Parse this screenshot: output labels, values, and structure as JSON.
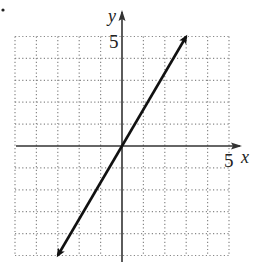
{
  "chart_data": {
    "type": "line",
    "title": "",
    "xlabel": "x",
    "ylabel": "y",
    "xlim": [
      -5,
      5
    ],
    "ylim": [
      -5,
      5
    ],
    "grid": true,
    "grid_style": "dotted",
    "grid_step": 1,
    "tick_labels": {
      "x": [
        "5"
      ],
      "y": [
        "5"
      ]
    },
    "series": [
      {
        "name": "line",
        "equation": "y = (5/3)x",
        "slope": 1.6667,
        "intercept": 0,
        "x": [
          -3,
          0,
          3
        ],
        "y": [
          -5,
          0,
          5
        ],
        "arrows_both_ends": true
      }
    ],
    "legend": null
  },
  "labels": {
    "x_axis": "x",
    "y_axis": "y",
    "x_tick": "5",
    "y_tick": "5"
  },
  "colors": {
    "line": "#111111",
    "axis": "#333333",
    "grid": "#888888"
  }
}
